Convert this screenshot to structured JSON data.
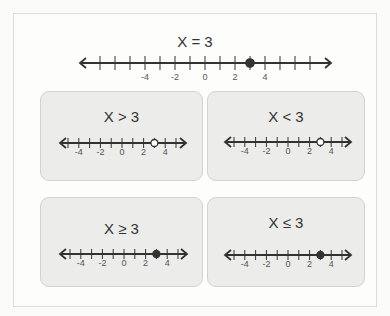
{
  "main": {
    "title": "X = 3",
    "number_line": {
      "min_tick": -7,
      "max_tick": 7,
      "labels": [
        "-4",
        "-2",
        "0",
        "2",
        "4"
      ],
      "label_values": [
        -4,
        -2,
        0,
        2,
        4
      ],
      "point": 3,
      "point_style": "closed"
    }
  },
  "cards": [
    {
      "title": "X > 3",
      "point": 3,
      "point_style": "open",
      "labels": [
        "-4",
        "-2",
        "0",
        "2",
        "4"
      ],
      "label_values": [
        -4,
        -2,
        0,
        2,
        4
      ],
      "min_tick": -5,
      "max_tick": 5
    },
    {
      "title": "X < 3",
      "point": 3,
      "point_style": "open",
      "labels": [
        "-4",
        "-2",
        "0",
        "2",
        "4"
      ],
      "label_values": [
        -4,
        -2,
        0,
        2,
        4
      ],
      "min_tick": -5,
      "max_tick": 5
    },
    {
      "title": "X ≥ 3",
      "point": 3,
      "point_style": "closed",
      "labels": [
        "-4",
        "-2",
        "0",
        "2",
        "4"
      ],
      "label_values": [
        -4,
        -2,
        0,
        2,
        4
      ],
      "min_tick": -5,
      "max_tick": 5
    },
    {
      "title": "X ≤ 3",
      "point": 3,
      "point_style": "closed",
      "labels": [
        "-4",
        "-2",
        "0",
        "2",
        "4"
      ],
      "label_values": [
        -4,
        -2,
        0,
        2,
        4
      ],
      "min_tick": -5,
      "max_tick": 5
    }
  ],
  "colors": {
    "line": "#333333",
    "card_bg": "#ececeb",
    "card_border": "#d3d3d3",
    "open_fill": "#ffffff"
  }
}
